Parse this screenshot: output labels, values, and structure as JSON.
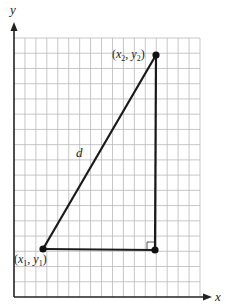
{
  "diagram": {
    "type": "distance-formula-right-triangle",
    "axes": {
      "x_label": "x",
      "y_label": "y",
      "origin_px": [
        14,
        297
      ],
      "x_end_px": 212,
      "y_end_px": 22,
      "color": "#222222"
    },
    "grid": {
      "left_px": 14,
      "top_px": 38,
      "right_px": 200,
      "bottom_px": 297,
      "columns": 17,
      "rows": 17,
      "color": "#b9b9b9"
    },
    "points": [
      {
        "id": "p1",
        "label": "(x1, y1)",
        "label_main": "(x",
        "sub_x": "1",
        "comma": ", y",
        "sub_y": "1",
        "close": ")",
        "px": [
          43,
          249
        ]
      },
      {
        "id": "p2",
        "label": "(x2, y2)",
        "label_main": "(x",
        "sub_x": "2",
        "comma": ", y",
        "sub_y": "2",
        "close": ")",
        "px": [
          156,
          55
        ]
      },
      {
        "id": "corner",
        "label": "",
        "px": [
          155,
          250
        ]
      }
    ],
    "segments": [
      {
        "name": "hypotenuse",
        "label": "d",
        "from": "p1",
        "to": "p2"
      },
      {
        "name": "horizontal-leg",
        "from": "p1",
        "to": "corner"
      },
      {
        "name": "vertical-leg",
        "from": "corner",
        "to": "p2"
      }
    ],
    "hypotenuse_label": "d",
    "right_angle_marker": {
      "at": "corner",
      "size_px": 7
    },
    "line_color": "#1a1a1a"
  }
}
